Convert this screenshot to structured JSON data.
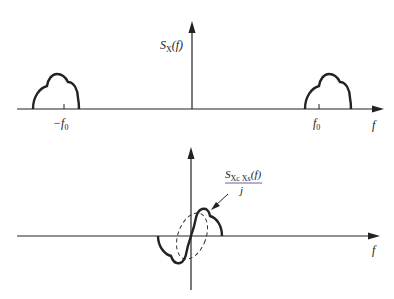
{
  "top_plot": {
    "y_label": "S",
    "y_label_sub": "X",
    "y_label_arg": "(f)",
    "x_label": "f",
    "tick_left": "−f",
    "tick_left_sub": "0",
    "tick_right": "f",
    "tick_right_sub": "0"
  },
  "bottom_plot": {
    "annotation_num": "S",
    "annotation_num_sub": "Xc Xs",
    "annotation_num_arg": "(f)",
    "annotation_den": "j",
    "x_label": "f"
  }
}
